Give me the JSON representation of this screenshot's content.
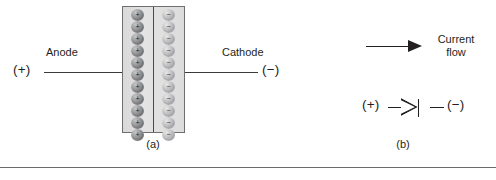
{
  "figure": {
    "panel_a": {
      "caption": "(a)",
      "terminal_positive": "(+)",
      "terminal_negative": "(−)",
      "anode_label": "Anode",
      "cathode_label": "Cathode",
      "junction": {
        "p_side": {
          "carrier_sign": "+",
          "carrier_count": 11,
          "carrier_color": "#6e6e71"
        },
        "n_side": {
          "carrier_sign": "−",
          "carrier_count": 11,
          "carrier_color": "#9d9da0"
        },
        "body_color": "#dcdcdc",
        "border_color": "#6f6f72"
      }
    },
    "panel_b": {
      "caption": "(b)",
      "arrow_label_line1": "Current",
      "arrow_label_line2": "flow",
      "terminal_positive": "(+)",
      "terminal_negative": "(−)",
      "symbol_name": "diode-symbol"
    },
    "colors": {
      "ink": "#231f20",
      "lead": "#3a3a3c",
      "rule": "#6b6b6e",
      "background": "#ffffff"
    }
  }
}
